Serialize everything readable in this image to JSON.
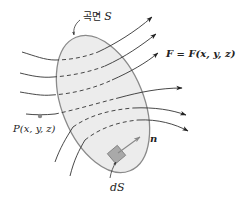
{
  "diagram": {
    "type": "surface-integral-vector-field",
    "surface_label_prefix": "곡면",
    "surface_label_var": "S",
    "field_label": "F = F(x, y, z)",
    "point_label": "P(x, y, z)",
    "normal_label": "n",
    "patch_label": "dS",
    "colors": {
      "surface_fill": "#ececec",
      "surface_stroke": "#8a8a8a",
      "flow_line": "#333333",
      "patch_fill": "#a9a9a9",
      "patch_stroke": "#7a7a7a",
      "normal_arrow": "#888888",
      "point_dot": "#8a8a8a"
    }
  }
}
